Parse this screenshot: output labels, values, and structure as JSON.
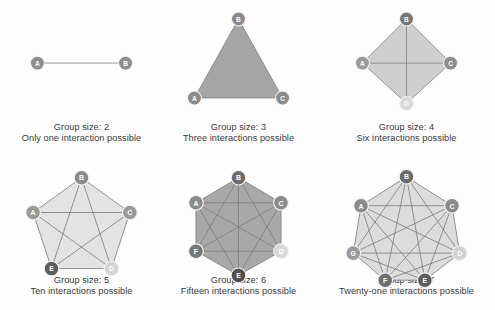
{
  "figure": {
    "background_color": "#fdfdfd",
    "caption_color": "#3a3a3a",
    "edge_color": "#7d7d7d",
    "node_stroke_color": "#f2f2f2",
    "node_label_color": "#ffffff"
  },
  "panels": [
    {
      "id": "group-size-2",
      "caption_line1": "Group size: 2",
      "caption_line2": "Only one interaction possible",
      "group_size": 2,
      "interactions": 1,
      "fill_color": "none",
      "nodes": [
        {
          "label": "A",
          "x": 22,
          "y": 60,
          "color": "#8d8d8d"
        },
        {
          "label": "B",
          "x": 118,
          "y": 60,
          "color": "#8d8d8d"
        }
      ],
      "edges": [
        [
          0,
          1
        ]
      ]
    },
    {
      "id": "group-size-3",
      "caption_line1": "Group size: 3",
      "caption_line2": "Three interactions possible",
      "group_size": 3,
      "interactions": 3,
      "fill_color": "#a5a5a5",
      "nodes": [
        {
          "label": "B",
          "x": 70,
          "y": 12,
          "color": "#8a8a8a"
        },
        {
          "label": "C",
          "x": 118,
          "y": 98,
          "color": "#8a8a8a"
        },
        {
          "label": "A",
          "x": 22,
          "y": 98,
          "color": "#8a8a8a"
        }
      ],
      "edges": [
        [
          0,
          1
        ],
        [
          1,
          2
        ],
        [
          2,
          0
        ]
      ]
    },
    {
      "id": "group-size-4",
      "caption_line1": "Group size: 4",
      "caption_line2": "Six interactions possible",
      "group_size": 4,
      "interactions": 6,
      "fill_color": "#cfcfcf",
      "nodes": [
        {
          "label": "B",
          "x": 70,
          "y": 12,
          "color": "#777777"
        },
        {
          "label": "C",
          "x": 118,
          "y": 60,
          "color": "#8d8d8d"
        },
        {
          "label": "D",
          "x": 70,
          "y": 104,
          "color": "#d8d8d8"
        },
        {
          "label": "A",
          "x": 22,
          "y": 60,
          "color": "#9a9a9a"
        }
      ],
      "edges": [
        [
          0,
          1
        ],
        [
          1,
          2
        ],
        [
          2,
          3
        ],
        [
          3,
          0
        ],
        [
          0,
          2
        ],
        [
          1,
          3
        ]
      ]
    },
    {
      "id": "group-size-5",
      "caption_line1": "Group size: 5",
      "caption_line2": "Ten interactions possible",
      "group_size": 5,
      "interactions": 10,
      "fill_color": "#e3e3e3",
      "nodes": [
        {
          "label": "B",
          "x": 70,
          "y": 10,
          "color": "#8a8a8a"
        },
        {
          "label": "C",
          "x": 120,
          "y": 46,
          "color": "#9a9a9a"
        },
        {
          "label": "D",
          "x": 101,
          "y": 104,
          "color": "#d5d5d5"
        },
        {
          "label": "E",
          "x": 39,
          "y": 104,
          "color": "#5d5d5d"
        },
        {
          "label": "A",
          "x": 20,
          "y": 46,
          "color": "#9a9a9a"
        }
      ],
      "edges": [
        [
          0,
          1
        ],
        [
          1,
          2
        ],
        [
          2,
          3
        ],
        [
          3,
          4
        ],
        [
          4,
          0
        ],
        [
          0,
          2
        ],
        [
          0,
          3
        ],
        [
          1,
          3
        ],
        [
          1,
          4
        ],
        [
          2,
          4
        ]
      ]
    },
    {
      "id": "group-size-6",
      "caption_line1": "Group size: 6",
      "caption_line2": "Fifteen interactions possible",
      "group_size": 6,
      "interactions": 15,
      "fill_color": "#a8a8a8",
      "nodes": [
        {
          "label": "B",
          "x": 70,
          "y": 10,
          "color": "#6b6b6b"
        },
        {
          "label": "C",
          "x": 114,
          "y": 36,
          "color": "#8a8a8a"
        },
        {
          "label": "D",
          "x": 114,
          "y": 86,
          "color": "#d8d8d8"
        },
        {
          "label": "E",
          "x": 70,
          "y": 111,
          "color": "#4f4f4f"
        },
        {
          "label": "F",
          "x": 26,
          "y": 86,
          "color": "#777777"
        },
        {
          "label": "A",
          "x": 26,
          "y": 36,
          "color": "#8a8a8a"
        }
      ],
      "edges": [
        [
          0,
          1
        ],
        [
          1,
          2
        ],
        [
          2,
          3
        ],
        [
          3,
          4
        ],
        [
          4,
          5
        ],
        [
          5,
          0
        ],
        [
          0,
          2
        ],
        [
          0,
          3
        ],
        [
          0,
          4
        ],
        [
          1,
          3
        ],
        [
          1,
          4
        ],
        [
          1,
          5
        ],
        [
          2,
          4
        ],
        [
          2,
          5
        ],
        [
          3,
          5
        ]
      ]
    },
    {
      "id": "group-size-7",
      "caption_line1": "Group size: 7",
      "caption_line2": "Twenty-one interactions possible",
      "group_size": 7,
      "interactions": 21,
      "fill_color": "#dcdcdc",
      "nodes": [
        {
          "label": "B",
          "x": 70,
          "y": 9,
          "color": "#6b6b6b"
        },
        {
          "label": "C",
          "x": 117,
          "y": 39,
          "color": "#8a8a8a"
        },
        {
          "label": "D",
          "x": 125,
          "y": 88,
          "color": "#d2d2d2"
        },
        {
          "label": "E",
          "x": 89,
          "y": 116,
          "color": "#5d5d5d"
        },
        {
          "label": "F",
          "x": 48,
          "y": 116,
          "color": "#6f6f6f"
        },
        {
          "label": "G",
          "x": 15,
          "y": 88,
          "color": "#9a9a9a"
        },
        {
          "label": "A",
          "x": 23,
          "y": 39,
          "color": "#8a8a8a"
        }
      ],
      "edges": [
        [
          0,
          1
        ],
        [
          1,
          2
        ],
        [
          2,
          3
        ],
        [
          3,
          4
        ],
        [
          4,
          5
        ],
        [
          5,
          6
        ],
        [
          6,
          0
        ],
        [
          0,
          2
        ],
        [
          0,
          3
        ],
        [
          0,
          4
        ],
        [
          0,
          5
        ],
        [
          1,
          3
        ],
        [
          1,
          4
        ],
        [
          1,
          5
        ],
        [
          1,
          6
        ],
        [
          2,
          4
        ],
        [
          2,
          5
        ],
        [
          2,
          6
        ],
        [
          3,
          5
        ],
        [
          3,
          6
        ],
        [
          4,
          6
        ]
      ]
    }
  ],
  "layout": {
    "columns": [
      {
        "left": 4,
        "width": 155
      },
      {
        "left": 161,
        "width": 155
      },
      {
        "left": 324,
        "width": 165
      }
    ],
    "rows": [
      {
        "top": 8,
        "graph_height": 112,
        "caption_top": 122
      },
      {
        "top": 168,
        "graph_height": 118,
        "caption_top": 275
      }
    ]
  }
}
